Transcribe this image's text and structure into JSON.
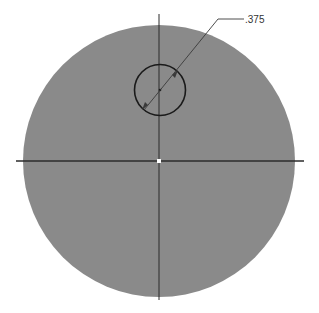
{
  "drawing": {
    "dimension_label": ".375",
    "colors": {
      "background": "#ffffff",
      "disk_fill": "#8a8a8a",
      "centerline": "#2b2b2b",
      "hole_outline": "#1a1a1a",
      "leader": "#3a3a3a",
      "center_marker": "#ffffff"
    }
  }
}
